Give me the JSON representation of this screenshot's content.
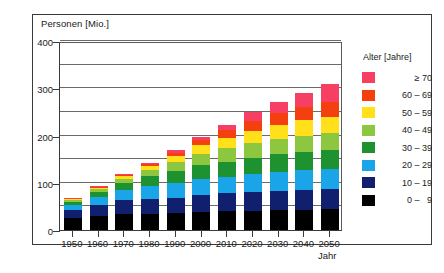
{
  "chart_data": {
    "type": "bar",
    "stacked": true,
    "title": "",
    "ylabel": "Personen [Mio.]",
    "xlabel": "Jahr",
    "categories": [
      "1950",
      "1960",
      "1970",
      "1980",
      "1990",
      "2000",
      "2010",
      "2020",
      "2030",
      "2040",
      "2050"
    ],
    "ylim": [
      0,
      400
    ],
    "yticks": [
      0,
      100,
      200,
      300,
      400
    ],
    "ytick_labels": [
      "0",
      "100",
      "200",
      "300",
      "400"
    ],
    "minor_gridlines": [
      50,
      150,
      250,
      350
    ],
    "grid": true,
    "legend_position": "right",
    "legend_title": "Alter [Jahre]",
    "series": [
      {
        "name": "0 -  9",
        "color": "#000000",
        "values": [
          25,
          30,
          34,
          33,
          35,
          39,
          40,
          41,
          42,
          43,
          44
        ]
      },
      {
        "name": "10 - 19",
        "color": "#11206e",
        "values": [
          17,
          24,
          29,
          33,
          33,
          35,
          38,
          40,
          41,
          42,
          43
        ]
      },
      {
        "name": "20 - 29",
        "color": "#19a5e8",
        "values": [
          11,
          16,
          22,
          28,
          32,
          33,
          35,
          38,
          40,
          41,
          42
        ]
      },
      {
        "name": "30 - 39",
        "color": "#1e9130",
        "values": [
          6,
          10,
          14,
          20,
          26,
          30,
          32,
          34,
          37,
          39,
          40
        ]
      },
      {
        "name": "40 - 49",
        "color": "#8dc63f",
        "values": [
          4,
          6,
          9,
          13,
          19,
          24,
          28,
          31,
          33,
          35,
          37
        ]
      },
      {
        "name": "50 - 59",
        "color": "#ffe01a",
        "values": [
          2,
          4,
          6,
          8,
          12,
          18,
          22,
          26,
          30,
          32,
          34
        ]
      },
      {
        "name": "60 - 69",
        "color": "#f43f0e",
        "values": [
          1,
          2,
          3,
          5,
          7,
          11,
          16,
          21,
          25,
          28,
          31
        ]
      },
      {
        "name": "≥ 70",
        "color": "#f73f63",
        "values": [
          1,
          1,
          2,
          3,
          5,
          8,
          12,
          18,
          24,
          31,
          38
        ]
      }
    ],
    "totals": [
      67,
      93,
      119,
      143,
      169,
      198,
      223,
      249,
      272,
      291,
      309
    ]
  },
  "legend": {
    "title": "Alter [Jahre]",
    "items": [
      {
        "label": "≥ 70",
        "color": "#f73f63"
      },
      {
        "label": "60 – 69",
        "color": "#f43f0e"
      },
      {
        "label": "50 – 59",
        "color": "#ffe01a"
      },
      {
        "label": "40 – 49",
        "color": "#8dc63f"
      },
      {
        "label": "30 – 39",
        "color": "#1e9130"
      },
      {
        "label": "20 – 29",
        "color": "#19a5e8"
      },
      {
        "label": "10 – 19",
        "color": "#11206e"
      },
      {
        "label": "0 –   9",
        "color": "#000000"
      }
    ]
  },
  "axes": {
    "y_caption": "Personen [Mio.]",
    "x_caption": "Jahr"
  }
}
